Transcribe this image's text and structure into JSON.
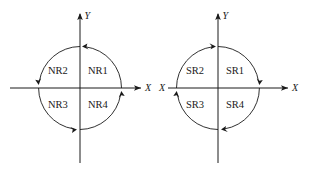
{
  "figure": {
    "stroke_color": "#1a1a1a",
    "background_color": "#ffffff",
    "left_diagram": {
      "name": "NR",
      "axis_x_label": "X",
      "axis_y_label": "Y",
      "quadrants": [
        {
          "id": "nr1",
          "label": "NR1",
          "position": "upper-right",
          "arrow_direction": "counterclockwise-up-left"
        },
        {
          "id": "nr2",
          "label": "NR2",
          "position": "upper-left",
          "arrow_direction": "clockwise-down-left"
        },
        {
          "id": "nr3",
          "label": "NR3",
          "position": "lower-left",
          "arrow_direction": "counterclockwise-down-right"
        },
        {
          "id": "nr4",
          "label": "NR4",
          "position": "lower-right",
          "arrow_direction": "clockwise-up-right"
        }
      ]
    },
    "right_diagram": {
      "name": "SR",
      "axis_x_label": "X",
      "axis_y_label": "Y",
      "axis_x_label_left": "X",
      "quadrants": [
        {
          "id": "sr1",
          "label": "SR1",
          "position": "upper-right",
          "arrow_direction": "clockwise-down-right"
        },
        {
          "id": "sr2",
          "label": "SR2",
          "position": "upper-left",
          "arrow_direction": "counterclockwise-up-right"
        },
        {
          "id": "sr3",
          "label": "SR3",
          "position": "lower-left",
          "arrow_direction": "clockwise-up-left"
        },
        {
          "id": "sr4",
          "label": "SR4",
          "position": "lower-right",
          "arrow_direction": "counterclockwise-down-left"
        }
      ]
    }
  }
}
